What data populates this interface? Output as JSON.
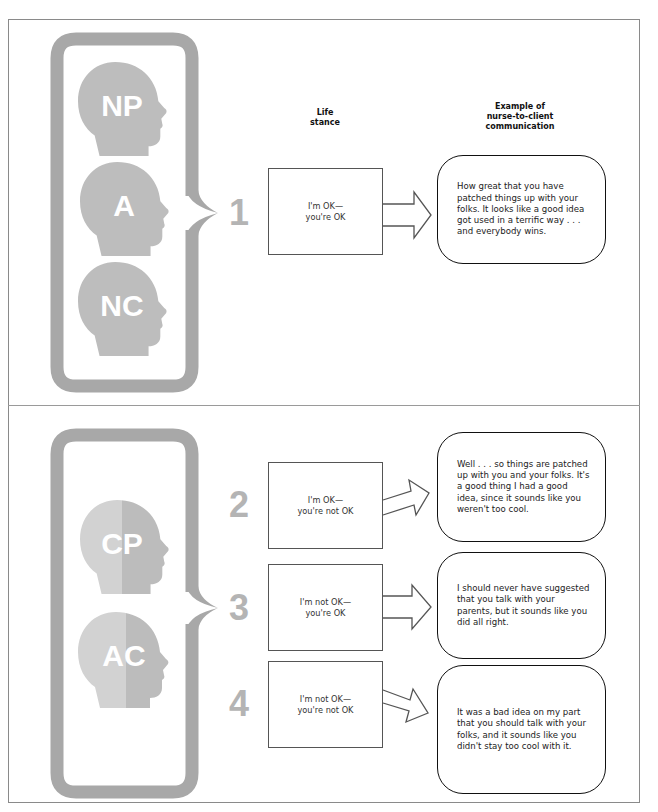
{
  "headers": {
    "life_stance": "Life\nstance",
    "life_stance_line1": "Life",
    "life_stance_line2": "stance",
    "example_line1": "Example of",
    "example_line2": "nurse-to-client",
    "example_line3": "communication"
  },
  "colors": {
    "bracket_gray": "#a6a6a6",
    "head_gray": "#bdbdbd",
    "head_light": "#cfcfcf",
    "number_gray": "#b4b4b4",
    "frame": "#8a8a8a"
  },
  "top_section": {
    "ego_states": [
      {
        "label": "NP",
        "icon": "head-silhouette-icon"
      },
      {
        "label": "A",
        "icon": "head-silhouette-icon"
      },
      {
        "label": "NC",
        "icon": "head-silhouette-icon"
      }
    ],
    "rows": [
      {
        "number": "1",
        "stance_line1": "I'm OK—",
        "stance_line2": "you're OK",
        "communication": "How great that you have patched things up with your folks. It looks like a good idea got used in a terrific way . . . and everybody wins."
      }
    ]
  },
  "bottom_section": {
    "ego_states": [
      {
        "label": "CP",
        "icon": "split-head-silhouette-icon"
      },
      {
        "label": "AC",
        "icon": "split-head-silhouette-icon"
      }
    ],
    "rows": [
      {
        "number": "2",
        "stance_line1": "I'm OK—",
        "stance_line2": "you're not OK",
        "communication": "Well . . . so things are patched up with you and your folks. It's a good thing I had a good idea, since it sounds like you weren't too cool."
      },
      {
        "number": "3",
        "stance_line1": "I'm not OK—",
        "stance_line2": "you're OK",
        "communication": "I should never have suggested that you talk with your parents, but it sounds like you did all right."
      },
      {
        "number": "4",
        "stance_line1": "I'm not OK—",
        "stance_line2": "you're not OK",
        "communication": "It was a bad idea on my part that you should talk with your folks, and it sounds like you didn't stay too cool with it."
      }
    ]
  }
}
